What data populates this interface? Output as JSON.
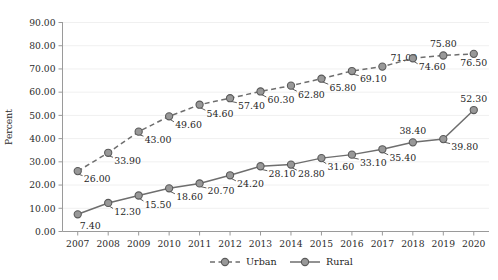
{
  "chart_data": {
    "type": "line",
    "title": "",
    "subtitle": "",
    "xlabel": "",
    "ylabel": "Percent",
    "xlim": [
      "2007",
      "2020"
    ],
    "ylim": [
      0,
      90
    ],
    "ytick_step": 10,
    "ytick_labels": [
      "0.00",
      "10.00",
      "20.00",
      "30.00",
      "40.00",
      "50.00",
      "60.00",
      "70.00",
      "80.00",
      "90.00"
    ],
    "grid": "faint-horizontal",
    "legend_position": "bottom-center",
    "categories": [
      "2007",
      "2008",
      "2009",
      "2010",
      "2011",
      "2012",
      "2013",
      "2014",
      "2015",
      "2016",
      "2017",
      "2018",
      "2019",
      "2020"
    ],
    "series": [
      {
        "name": "Urban",
        "line_style": "dashed",
        "marker": "circle",
        "color": "#8c8c8c",
        "values": [
          26.0,
          33.9,
          43.0,
          49.6,
          54.6,
          57.4,
          60.3,
          62.8,
          65.8,
          69.1,
          71.0,
          74.6,
          75.8,
          76.5
        ],
        "value_labels": [
          "26.00",
          "33.90",
          "43.00",
          "49.60",
          "54.60",
          "57.40",
          "60.30",
          "62.80",
          "65.80",
          "69.10",
          "71.00",
          "74.60",
          "75.80",
          "76.50"
        ]
      },
      {
        "name": "Rural",
        "line_style": "solid",
        "marker": "circle",
        "color": "#7f7f7f",
        "values": [
          7.4,
          12.3,
          15.5,
          18.6,
          20.7,
          24.2,
          28.1,
          28.8,
          31.6,
          33.1,
          35.4,
          38.4,
          39.8,
          52.3
        ],
        "value_labels": [
          "7.40",
          "12.30",
          "15.50",
          "18.60",
          "20.70",
          "24.20",
          "28.10",
          "28.80",
          "31.60",
          "33.10",
          "35.40",
          "38.40",
          "39.80",
          "52.30"
        ]
      }
    ]
  },
  "legend": {
    "items": [
      {
        "label": "Urban",
        "style": "dashed"
      },
      {
        "label": "Rural",
        "style": "solid"
      }
    ]
  },
  "colors": {
    "line": "#6e6e6e",
    "marker_fill": "#989898",
    "marker_stroke": "#5a5a5a",
    "axis": "#9a9a9a",
    "text": "#1f1f1f",
    "grid": "#f0f0f0"
  }
}
